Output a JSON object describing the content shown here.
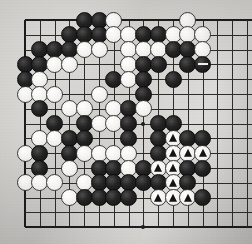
{
  "diagram": {
    "kind": "go-board-diagram",
    "board_size_visible": {
      "cols": 15,
      "rows": 15
    },
    "geometry": {
      "origin_x": 25,
      "origin_y": 20,
      "spacing": 14.8,
      "stone_diameter": 17
    },
    "colors": {
      "paper": "#d9d7d3",
      "line": "#2b2b2b",
      "black_stone": "#141414",
      "white_stone": "#f5f4f2",
      "mark": "#111111"
    },
    "star_points": [
      {
        "col": 8,
        "row": 7
      },
      {
        "col": 8,
        "row": 14
      }
    ],
    "edges": {
      "top": true,
      "left": true,
      "bottom": true,
      "right": true
    },
    "stones": [
      {
        "col": 4,
        "row": 0,
        "color": "black"
      },
      {
        "col": 5,
        "row": 0,
        "color": "black"
      },
      {
        "col": 6,
        "row": 0,
        "color": "white"
      },
      {
        "col": 11,
        "row": 0,
        "color": "white"
      },
      {
        "col": 3,
        "row": 1,
        "color": "black"
      },
      {
        "col": 4,
        "row": 1,
        "color": "black"
      },
      {
        "col": 5,
        "row": 1,
        "color": "black"
      },
      {
        "col": 6,
        "row": 1,
        "color": "white"
      },
      {
        "col": 7,
        "row": 1,
        "color": "white"
      },
      {
        "col": 8,
        "row": 1,
        "color": "black"
      },
      {
        "col": 9,
        "row": 1,
        "color": "black"
      },
      {
        "col": 10,
        "row": 1,
        "color": "white"
      },
      {
        "col": 11,
        "row": 1,
        "color": "white"
      },
      {
        "col": 12,
        "row": 1,
        "color": "white"
      },
      {
        "col": 1,
        "row": 2,
        "color": "black"
      },
      {
        "col": 2,
        "row": 2,
        "color": "black"
      },
      {
        "col": 3,
        "row": 2,
        "color": "black"
      },
      {
        "col": 4,
        "row": 2,
        "color": "white"
      },
      {
        "col": 5,
        "row": 2,
        "color": "white"
      },
      {
        "col": 7,
        "row": 2,
        "color": "white"
      },
      {
        "col": 8,
        "row": 2,
        "color": "white"
      },
      {
        "col": 9,
        "row": 2,
        "color": "white"
      },
      {
        "col": 10,
        "row": 2,
        "color": "black"
      },
      {
        "col": 11,
        "row": 2,
        "color": "black"
      },
      {
        "col": 12,
        "row": 2,
        "color": "white"
      },
      {
        "col": 0,
        "row": 3,
        "color": "black"
      },
      {
        "col": 1,
        "row": 3,
        "color": "black"
      },
      {
        "col": 2,
        "row": 3,
        "color": "white"
      },
      {
        "col": 3,
        "row": 3,
        "color": "white"
      },
      {
        "col": 7,
        "row": 3,
        "color": "white"
      },
      {
        "col": 8,
        "row": 3,
        "color": "black"
      },
      {
        "col": 9,
        "row": 3,
        "color": "black"
      },
      {
        "col": 11,
        "row": 3,
        "color": "black"
      },
      {
        "col": 12,
        "row": 3,
        "color": "black",
        "mark": "bar"
      },
      {
        "col": 0,
        "row": 4,
        "color": "black"
      },
      {
        "col": 1,
        "row": 4,
        "color": "white"
      },
      {
        "col": 6,
        "row": 4,
        "color": "black"
      },
      {
        "col": 7,
        "row": 4,
        "color": "white"
      },
      {
        "col": 8,
        "row": 4,
        "color": "black"
      },
      {
        "col": 10,
        "row": 4,
        "color": "black"
      },
      {
        "col": 0,
        "row": 5,
        "color": "white"
      },
      {
        "col": 1,
        "row": 5,
        "color": "white"
      },
      {
        "col": 2,
        "row": 5,
        "color": "white"
      },
      {
        "col": 5,
        "row": 5,
        "color": "white"
      },
      {
        "col": 8,
        "row": 5,
        "color": "black"
      },
      {
        "col": 1,
        "row": 6,
        "color": "black"
      },
      {
        "col": 3,
        "row": 6,
        "color": "white"
      },
      {
        "col": 4,
        "row": 6,
        "color": "white"
      },
      {
        "col": 6,
        "row": 6,
        "color": "white"
      },
      {
        "col": 7,
        "row": 6,
        "color": "black"
      },
      {
        "col": 8,
        "row": 6,
        "color": "white"
      },
      {
        "col": 2,
        "row": 7,
        "color": "black"
      },
      {
        "col": 4,
        "row": 7,
        "color": "black"
      },
      {
        "col": 5,
        "row": 7,
        "color": "white"
      },
      {
        "col": 6,
        "row": 7,
        "color": "white"
      },
      {
        "col": 7,
        "row": 7,
        "color": "black"
      },
      {
        "col": 9,
        "row": 7,
        "color": "black"
      },
      {
        "col": 10,
        "row": 7,
        "color": "black"
      },
      {
        "col": 1,
        "row": 8,
        "color": "white"
      },
      {
        "col": 2,
        "row": 8,
        "color": "white"
      },
      {
        "col": 3,
        "row": 8,
        "color": "black"
      },
      {
        "col": 4,
        "row": 8,
        "color": "black"
      },
      {
        "col": 7,
        "row": 8,
        "color": "black"
      },
      {
        "col": 9,
        "row": 8,
        "color": "black"
      },
      {
        "col": 10,
        "row": 8,
        "color": "white",
        "mark": "triangle"
      },
      {
        "col": 11,
        "row": 8,
        "color": "black"
      },
      {
        "col": 12,
        "row": 8,
        "color": "black"
      },
      {
        "col": 0,
        "row": 9,
        "color": "white"
      },
      {
        "col": 1,
        "row": 9,
        "color": "black"
      },
      {
        "col": 3,
        "row": 9,
        "color": "black"
      },
      {
        "col": 4,
        "row": 9,
        "color": "white"
      },
      {
        "col": 5,
        "row": 9,
        "color": "white"
      },
      {
        "col": 6,
        "row": 9,
        "color": "white"
      },
      {
        "col": 7,
        "row": 9,
        "color": "white"
      },
      {
        "col": 9,
        "row": 9,
        "color": "black"
      },
      {
        "col": 10,
        "row": 9,
        "color": "white",
        "mark": "triangle"
      },
      {
        "col": 11,
        "row": 9,
        "color": "white",
        "mark": "triangle"
      },
      {
        "col": 12,
        "row": 9,
        "color": "white",
        "mark": "triangle"
      },
      {
        "col": 1,
        "row": 10,
        "color": "black"
      },
      {
        "col": 3,
        "row": 10,
        "color": "white"
      },
      {
        "col": 5,
        "row": 10,
        "color": "black"
      },
      {
        "col": 6,
        "row": 10,
        "color": "black"
      },
      {
        "col": 7,
        "row": 10,
        "color": "white"
      },
      {
        "col": 8,
        "row": 10,
        "color": "black"
      },
      {
        "col": 9,
        "row": 10,
        "color": "white",
        "mark": "triangle"
      },
      {
        "col": 10,
        "row": 10,
        "color": "white",
        "mark": "triangle"
      },
      {
        "col": 11,
        "row": 10,
        "color": "black"
      },
      {
        "col": 12,
        "row": 10,
        "color": "black"
      },
      {
        "col": 0,
        "row": 11,
        "color": "white"
      },
      {
        "col": 1,
        "row": 11,
        "color": "white"
      },
      {
        "col": 2,
        "row": 11,
        "color": "white"
      },
      {
        "col": 4,
        "row": 11,
        "color": "white"
      },
      {
        "col": 5,
        "row": 11,
        "color": "black"
      },
      {
        "col": 6,
        "row": 11,
        "color": "black"
      },
      {
        "col": 7,
        "row": 11,
        "color": "black"
      },
      {
        "col": 8,
        "row": 11,
        "color": "black"
      },
      {
        "col": 9,
        "row": 11,
        "color": "black"
      },
      {
        "col": 10,
        "row": 11,
        "color": "white",
        "mark": "triangle"
      },
      {
        "col": 11,
        "row": 11,
        "color": "black"
      },
      {
        "col": 3,
        "row": 12,
        "color": "white"
      },
      {
        "col": 4,
        "row": 12,
        "color": "black"
      },
      {
        "col": 5,
        "row": 12,
        "color": "black"
      },
      {
        "col": 6,
        "row": 12,
        "color": "black"
      },
      {
        "col": 7,
        "row": 12,
        "color": "black"
      },
      {
        "col": 9,
        "row": 12,
        "color": "white",
        "mark": "triangle"
      },
      {
        "col": 10,
        "row": 12,
        "color": "white",
        "mark": "triangle"
      },
      {
        "col": 11,
        "row": 12,
        "color": "white",
        "mark": "triangle"
      },
      {
        "col": 12,
        "row": 12,
        "color": "black"
      }
    ]
  }
}
